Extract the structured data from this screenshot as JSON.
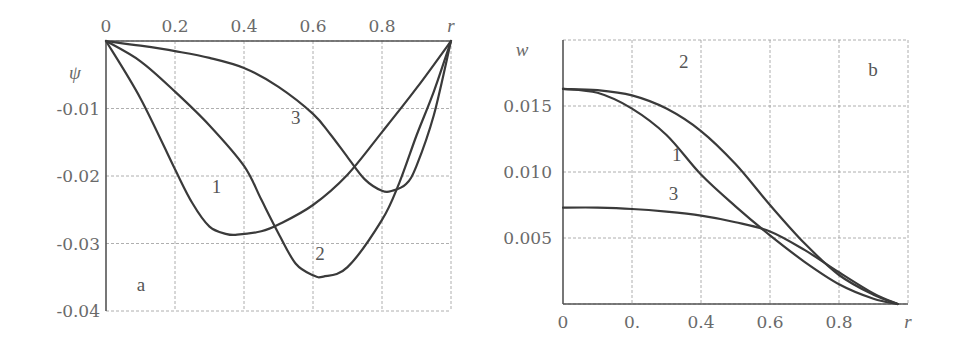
{
  "chart_data": [
    {
      "panel": "a",
      "type": "line",
      "title": "",
      "xlabel": "r",
      "ylabel": "ψ",
      "xlim": [
        0,
        1
      ],
      "ylim": [
        -0.04,
        0
      ],
      "x_ticks": [
        "0",
        "0.2",
        "0.4",
        "0.6",
        "0.8",
        "r"
      ],
      "y_ticks": [
        "-0.01",
        "-0.02",
        "-0.03",
        "-0.04"
      ],
      "x_axis_position": "top",
      "grid": true,
      "panel_label": "a",
      "series": [
        {
          "name": "1",
          "x": [
            0,
            0.1,
            0.2,
            0.25,
            0.3,
            0.35,
            0.38,
            0.45,
            0.5,
            0.6,
            0.7,
            0.8,
            0.9,
            1.0
          ],
          "y": [
            0,
            -0.0085,
            -0.019,
            -0.024,
            -0.0275,
            -0.0286,
            -0.0287,
            -0.0282,
            -0.0272,
            -0.0243,
            -0.0198,
            -0.0135,
            -0.007,
            0
          ]
        },
        {
          "name": "2",
          "x": [
            0,
            0.1,
            0.2,
            0.3,
            0.4,
            0.45,
            0.5,
            0.55,
            0.6,
            0.63,
            0.7,
            0.8,
            0.85,
            0.9,
            0.95,
            1.0
          ],
          "y": [
            0,
            -0.003,
            -0.0075,
            -0.0125,
            -0.0185,
            -0.0235,
            -0.0285,
            -0.033,
            -0.0347,
            -0.0349,
            -0.0335,
            -0.0265,
            -0.021,
            -0.014,
            -0.0075,
            0
          ]
        },
        {
          "name": "3",
          "x": [
            0,
            0.1,
            0.2,
            0.3,
            0.4,
            0.5,
            0.6,
            0.65,
            0.7,
            0.75,
            0.8,
            0.83,
            0.87,
            0.9,
            0.95,
            1.0
          ],
          "y": [
            0,
            -0.0007,
            -0.0015,
            -0.0025,
            -0.004,
            -0.0068,
            -0.0108,
            -0.0138,
            -0.0172,
            -0.0205,
            -0.0222,
            -0.0222,
            -0.0212,
            -0.0185,
            -0.011,
            0
          ]
        }
      ],
      "annotations": [
        {
          "text": "1",
          "x": 0.32,
          "y": -0.0225
        },
        {
          "text": "2",
          "x": 0.62,
          "y": -0.0325
        },
        {
          "text": "3",
          "x": 0.55,
          "y": -0.0123
        }
      ]
    },
    {
      "panel": "b",
      "type": "line",
      "title": "",
      "xlabel": "r",
      "ylabel": "w",
      "xlim": [
        0,
        1
      ],
      "ylim": [
        0,
        0.02
      ],
      "x_ticks": [
        "0",
        "0.",
        "0.4",
        "0.6",
        "0.8",
        "r"
      ],
      "y_ticks": [
        "0.015",
        "0.010",
        "0.005"
      ],
      "x_axis_position": "bottom",
      "grid": true,
      "panel_label": "b",
      "series": [
        {
          "name": "1",
          "x": [
            0,
            0.1,
            0.2,
            0.3,
            0.4,
            0.5,
            0.6,
            0.7,
            0.8,
            0.9,
            0.97
          ],
          "y": [
            0.0163,
            0.016,
            0.0148,
            0.0128,
            0.0098,
            0.0074,
            0.0052,
            0.0032,
            0.0015,
            0.0004,
            0
          ]
        },
        {
          "name": "2",
          "x": [
            0,
            0.1,
            0.2,
            0.3,
            0.4,
            0.5,
            0.6,
            0.7,
            0.8,
            0.9,
            0.97
          ],
          "y": [
            0.0163,
            0.0162,
            0.0158,
            0.0148,
            0.0131,
            0.0106,
            0.0075,
            0.0046,
            0.0022,
            0.0007,
            0
          ]
        },
        {
          "name": "3",
          "x": [
            0,
            0.1,
            0.2,
            0.3,
            0.4,
            0.5,
            0.6,
            0.7,
            0.8,
            0.9,
            0.97
          ],
          "y": [
            0.0073,
            0.0073,
            0.0072,
            0.007,
            0.0067,
            0.0062,
            0.0055,
            0.0041,
            0.0024,
            0.0008,
            0
          ]
        }
      ],
      "annotations": [
        {
          "text": "2",
          "x": 0.35,
          "y": 0.0179
        },
        {
          "text": "1",
          "x": 0.33,
          "y": 0.0108
        },
        {
          "text": "3",
          "x": 0.32,
          "y": 0.0079
        }
      ]
    }
  ]
}
